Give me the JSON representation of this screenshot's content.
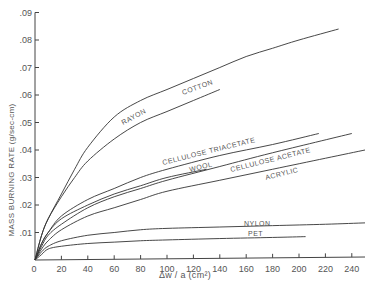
{
  "chart_data": {
    "type": "line",
    "title": "",
    "xlabel": "Δw / a (cm²)",
    "ylabel": "MASS BURNING RATE (g/sec-cm)",
    "xlim": [
      0,
      250
    ],
    "ylim": [
      0,
      0.09
    ],
    "x_ticks": [
      0,
      20,
      40,
      60,
      80,
      100,
      120,
      140,
      160,
      180,
      200,
      220,
      240
    ],
    "x_tick_labels": [
      "0",
      "20",
      "40",
      "60",
      "80",
      "100",
      "120",
      "140",
      "160",
      "180",
      "200",
      "220",
      "240"
    ],
    "y_ticks": [
      0.01,
      0.02,
      0.03,
      0.04,
      0.05,
      0.06,
      0.07,
      0.08,
      0.09
    ],
    "y_tick_labels": [
      ".01",
      ".02",
      ".03",
      ".04",
      ".05",
      ".06",
      ".07",
      ".08",
      ".09"
    ],
    "grid": false,
    "legend": "inline labels on curves",
    "series": [
      {
        "name": "COTTON",
        "x": [
          0,
          5,
          10,
          20,
          30,
          40,
          60,
          80,
          100,
          120,
          140,
          160,
          180,
          200,
          230
        ],
        "y": [
          0,
          0.009,
          0.015,
          0.024,
          0.033,
          0.041,
          0.052,
          0.058,
          0.062,
          0.066,
          0.07,
          0.074,
          0.077,
          0.08,
          0.084
        ],
        "label_pos": [
          183,
          95
        ],
        "label_angle": -20
      },
      {
        "name": "RAYON",
        "x": [
          0,
          5,
          10,
          20,
          30,
          40,
          60,
          80,
          100,
          120,
          140
        ],
        "y": [
          0,
          0.009,
          0.015,
          0.023,
          0.03,
          0.036,
          0.044,
          0.05,
          0.054,
          0.058,
          0.062
        ],
        "label_pos": [
          123,
          125
        ],
        "label_angle": -28
      },
      {
        "name": "CELLULOSE TRIACETATE",
        "x": [
          0,
          5,
          10,
          20,
          40,
          60,
          80,
          100,
          140,
          180,
          215
        ],
        "y": [
          0,
          0.006,
          0.01,
          0.016,
          0.022,
          0.026,
          0.03,
          0.033,
          0.038,
          0.042,
          0.046
        ],
        "label_pos": [
          163,
          165
        ],
        "label_angle": -14
      },
      {
        "name": "WOOL",
        "x": [
          0,
          5,
          10,
          20,
          40,
          60,
          80,
          100,
          130
        ],
        "y": [
          0,
          0.006,
          0.01,
          0.015,
          0.02,
          0.024,
          0.027,
          0.03,
          0.033
        ],
        "label_pos": [
          190,
          172
        ],
        "label_angle": -14
      },
      {
        "name": "CELLULOSE ACETATE",
        "x": [
          0,
          5,
          10,
          20,
          40,
          60,
          80,
          100,
          140,
          180,
          240
        ],
        "y": [
          0,
          0.005,
          0.009,
          0.013,
          0.019,
          0.023,
          0.026,
          0.029,
          0.034,
          0.039,
          0.046
        ],
        "label_pos": [
          231,
          172
        ],
        "label_angle": -14
      },
      {
        "name": "ACRYLIC",
        "x": [
          0,
          5,
          10,
          20,
          40,
          60,
          80,
          100,
          140,
          180,
          220,
          250
        ],
        "y": [
          0,
          0.004,
          0.007,
          0.011,
          0.016,
          0.019,
          0.022,
          0.025,
          0.029,
          0.033,
          0.037,
          0.04
        ],
        "label_pos": [
          266,
          180
        ],
        "label_angle": -14
      },
      {
        "name": "NYLON",
        "x": [
          0,
          5,
          10,
          20,
          40,
          60,
          80,
          100,
          140,
          180,
          220,
          250
        ],
        "y": [
          0,
          0.003,
          0.005,
          0.007,
          0.009,
          0.01,
          0.011,
          0.0115,
          0.012,
          0.0125,
          0.013,
          0.0135
        ],
        "label_pos": [
          244,
          226
        ],
        "label_angle": 0
      },
      {
        "name": "PET",
        "x": [
          0,
          5,
          10,
          20,
          40,
          60,
          80,
          100,
          140,
          180,
          205
        ],
        "y": [
          0,
          0.002,
          0.004,
          0.005,
          0.006,
          0.0065,
          0.007,
          0.0073,
          0.0078,
          0.0082,
          0.0085
        ],
        "label_pos": [
          248,
          236
        ],
        "label_angle": 0
      }
    ]
  },
  "axes": {
    "x_title": "Δw / a (cm²)",
    "y_title": "MASS BURNING RATE (g/sec-cm)",
    "origin_label": "0"
  },
  "style": {
    "line_color": "#333333",
    "axis_color": "#444444",
    "text_color": "#555555"
  }
}
